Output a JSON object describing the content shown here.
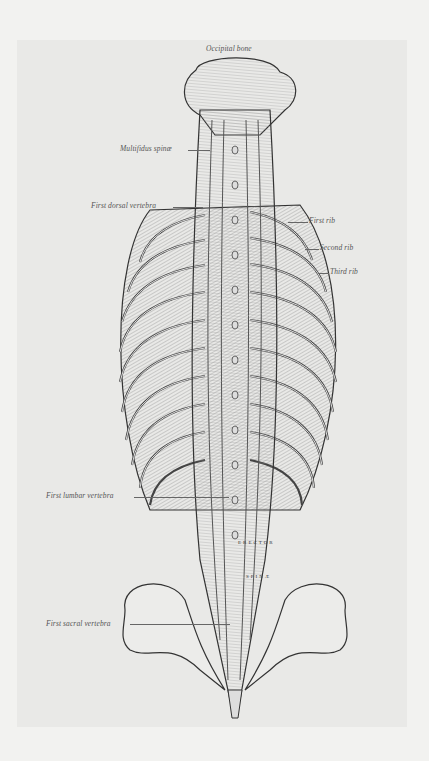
{
  "figure": {
    "labels": {
      "occipital_bone": "Occipital bone",
      "multifidus_spinae": "Multifidus spinæ",
      "first_dorsal_vertebra": "First dorsal vertebra",
      "first_rib": "First rib",
      "second_rib": "Second rib",
      "third_rib": "Third rib",
      "first_lumbar_vertebra": "First lumbar vertebra",
      "first_sacral_vertebra": "First sacral vertebra"
    },
    "muscle_lettering": {
      "erector": "ERECTOR",
      "spinae": "SPINÆ",
      "spinalis_dorsi": "SPINALIS DORSI",
      "ilio_costalis": "ILIO-COSTALIS",
      "accessorius": "ACCESSORIUS",
      "semispinalis_dorsi": "SEMISPINALIS DORSI",
      "longissimus_dorsi": "LONGISSIMUS DORSI"
    },
    "colors": {
      "page_bg": "#f2f2f0",
      "plate_bg": "#e9e9e7",
      "ink": "#3a3a3a"
    }
  }
}
